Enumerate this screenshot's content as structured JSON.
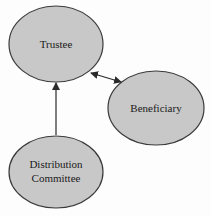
{
  "diagram": {
    "nodes": [
      {
        "id": "trustee",
        "label_lines": [
          "Trustee"
        ],
        "cx": 56,
        "cy": 44,
        "rx": 47,
        "ry": 38
      },
      {
        "id": "beneficiary",
        "label_lines": [
          "Beneficiary"
        ],
        "cx": 156,
        "cy": 108,
        "rx": 48,
        "ry": 37
      },
      {
        "id": "distribution-committee",
        "label_lines": [
          "Distribution",
          "Committee"
        ],
        "cx": 56,
        "cy": 172,
        "rx": 47,
        "ry": 36
      }
    ],
    "edges": [
      {
        "from": "distribution-committee",
        "to": "trustee",
        "direction": "single"
      },
      {
        "from": "trustee",
        "to": "beneficiary",
        "direction": "double"
      }
    ],
    "colors": {
      "node_fill": "#c8c8c8",
      "node_stroke": "#3a3a3a",
      "edge": "#2a2a2a",
      "background": "#fdfdfd"
    }
  }
}
